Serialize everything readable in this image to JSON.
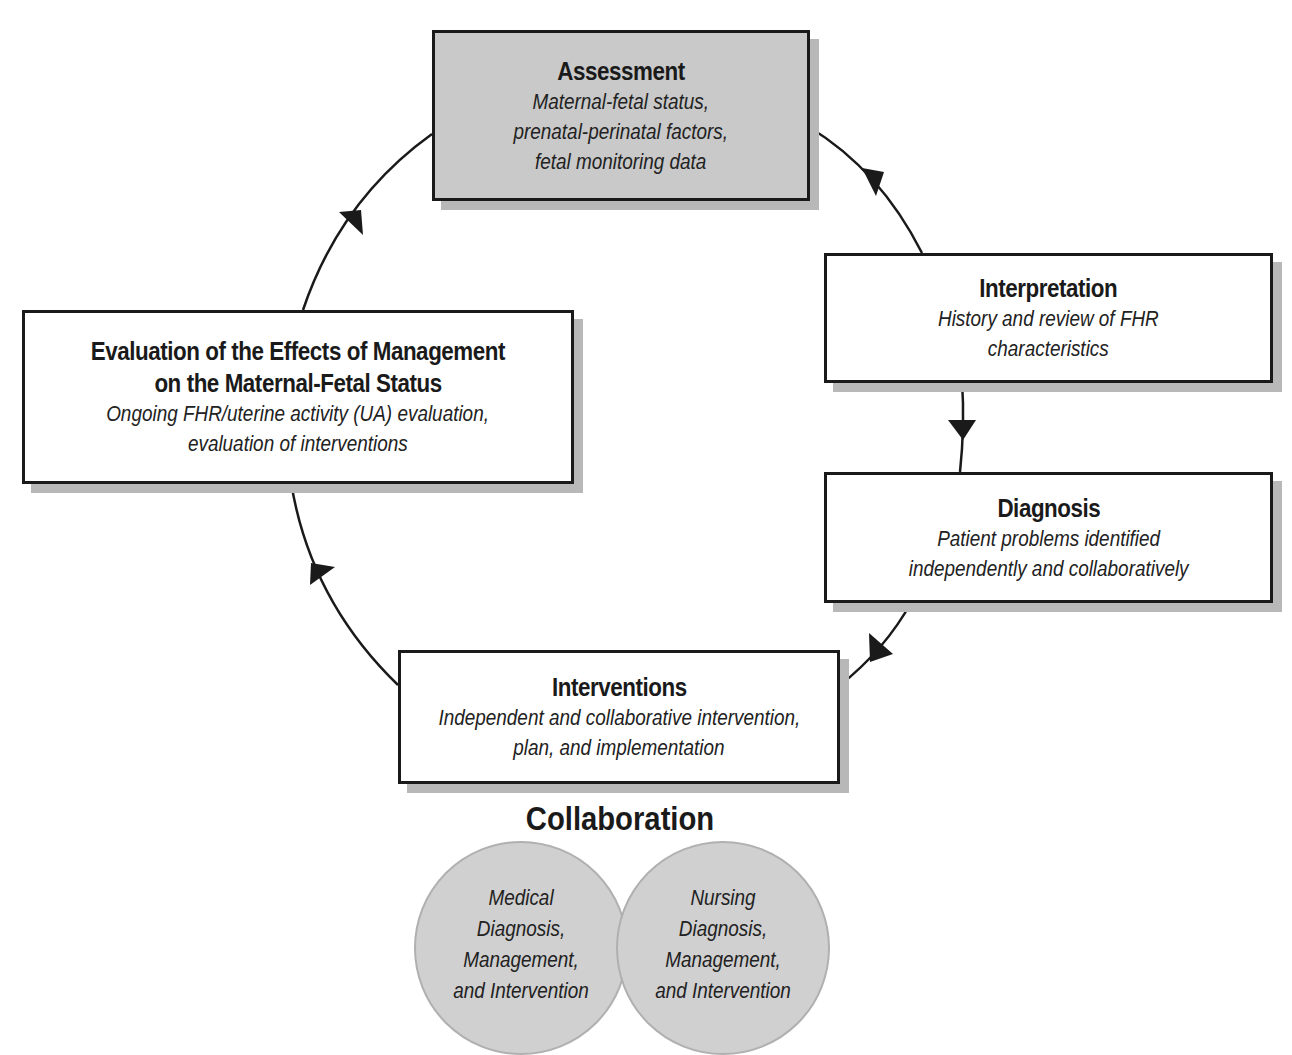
{
  "diagram": {
    "nodes": [
      {
        "id": "assessment",
        "title": "Assessment",
        "lines": [
          "Maternal-fetal status,",
          "prenatal-perinatal factors,",
          "fetal monitoring data"
        ],
        "fill": "#c9c9c9"
      },
      {
        "id": "interpretation",
        "title": "Interpretation",
        "lines": [
          "History and review of FHR",
          "characteristics"
        ],
        "fill": "#ffffff"
      },
      {
        "id": "diagnosis",
        "title": "Diagnosis",
        "lines": [
          "Patient problems identified",
          "independently and collaboratively"
        ],
        "fill": "#ffffff"
      },
      {
        "id": "interventions",
        "title": "Interventions",
        "lines": [
          "Independent and collaborative intervention,",
          "plan, and implementation"
        ],
        "fill": "#ffffff"
      },
      {
        "id": "evaluation",
        "title_lines": [
          "Evaluation of the Effects of Management",
          "on the Maternal-Fetal Status"
        ],
        "lines": [
          "Ongoing FHR/uterine activity (UA) evaluation,",
          "evaluation of interventions"
        ],
        "fill": "#ffffff"
      }
    ],
    "cycle_order": [
      "assessment",
      "interpretation",
      "diagnosis",
      "interventions",
      "evaluation",
      "assessment"
    ],
    "collaboration": {
      "title": "Collaboration",
      "circles": [
        {
          "id": "medical",
          "lines": [
            "Medical",
            "Diagnosis,",
            "Management,",
            "and Intervention"
          ]
        },
        {
          "id": "nursing",
          "lines": [
            "Nursing",
            "Diagnosis,",
            "Management,",
            "and Intervention"
          ]
        }
      ],
      "circle_fill": "#d0d0d0"
    },
    "colors": {
      "border": "#1a1a1a",
      "shadow": "#b8b8b8",
      "shaded_box": "#c9c9c9"
    }
  }
}
